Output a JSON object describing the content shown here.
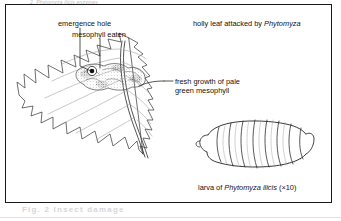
{
  "figure": {
    "title_caption": "holly leaf attacked by Phytomyza",
    "title_caption_plain": "holly leaf attacked by ",
    "title_caption_genus": "Phytomyza",
    "larva_caption_plain": "larva of ",
    "larva_caption_species": "Phytomyza ilicis",
    "larva_caption_magnification": " (×10)"
  },
  "labels": {
    "emergence_hole": "emergence hole",
    "mesophyll_eaten": "mesophyll eaten",
    "fresh_growth_line1": "fresh growth of pale",
    "fresh_growth_line2": "green mesophyll"
  },
  "ghost": {
    "top": "2, Phytomyza ilicis enzymes",
    "bottom": "Fig. 2  Insect  damage"
  },
  "icons": {
    "holly_leaf": "holly-leaf-icon",
    "larva": "fly-larva-icon",
    "emergence_hole_marker": "emergence-hole-dot-icon",
    "leader_line": "leader-line-icon"
  },
  "colors": {
    "ink": "#1a1a1a",
    "line": "#4a4a4a",
    "background": "#ffffff",
    "stipple": "#8a8a8a",
    "ghost": "#d6d6d6"
  }
}
